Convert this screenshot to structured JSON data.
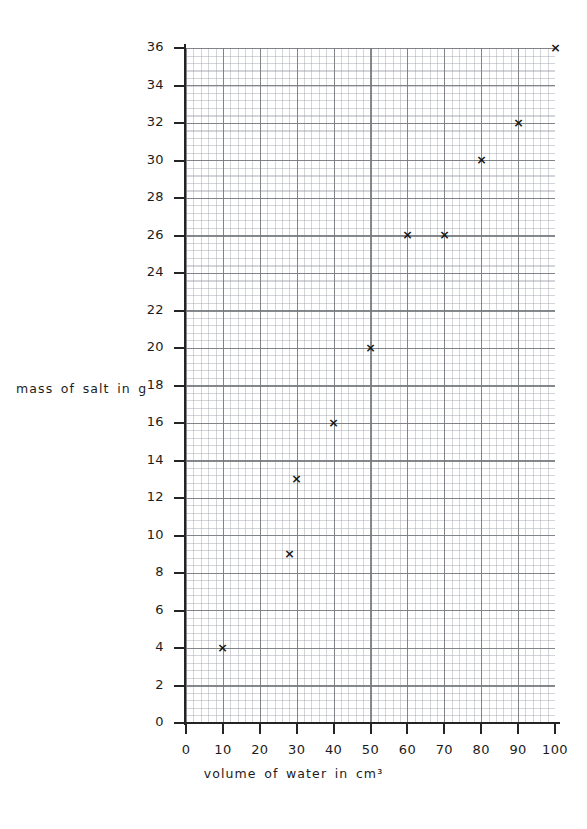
{
  "chart_data": {
    "type": "scatter",
    "title": "",
    "xlabel": "volume of water in cm³",
    "ylabel": "mass of salt in g",
    "xlim": [
      0,
      100
    ],
    "ylim": [
      0,
      36
    ],
    "xticks": [
      0,
      10,
      20,
      30,
      40,
      50,
      60,
      70,
      80,
      90,
      100
    ],
    "yticks": [
      0,
      2,
      4,
      6,
      8,
      10,
      12,
      14,
      16,
      18,
      20,
      22,
      24,
      26,
      28,
      30,
      32,
      34,
      36
    ],
    "xtick_labels": [
      "0",
      "10",
      "20",
      "30",
      "40",
      "50",
      "60",
      "70",
      "80",
      "90",
      "100"
    ],
    "ytick_labels": [
      "0",
      "2",
      "4",
      "6",
      "8",
      "10",
      "12",
      "14",
      "16",
      "18",
      "20",
      "22",
      "24",
      "26",
      "28",
      "30",
      "32",
      "34",
      "36"
    ],
    "grid": true,
    "grid_minor": true,
    "legend": null,
    "marker_symbol": "×",
    "marker_color": "#151515",
    "grid_major_color": "#73767a",
    "grid_minor_color": "#969ba5",
    "axis_color": "#242424",
    "background_color": "#ffffff",
    "points": [
      {
        "x": 10,
        "y": 4
      },
      {
        "x": 28,
        "y": 9
      },
      {
        "x": 30,
        "y": 13
      },
      {
        "x": 40,
        "y": 16
      },
      {
        "x": 50,
        "y": 20
      },
      {
        "x": 60,
        "y": 26
      },
      {
        "x": 70,
        "y": 26
      },
      {
        "x": 80,
        "y": 30
      },
      {
        "x": 90,
        "y": 32
      },
      {
        "x": 100,
        "y": 36
      }
    ]
  }
}
